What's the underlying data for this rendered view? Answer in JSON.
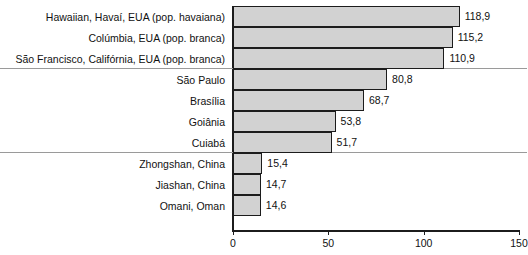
{
  "chart_data": {
    "type": "bar",
    "orientation": "horizontal",
    "title": "",
    "subtitle": "",
    "xlabel": "",
    "ylabel": "",
    "xlim": [
      0,
      150
    ],
    "xticks": [
      0,
      50,
      100,
      150
    ],
    "xtick_labels": [
      "0",
      "50",
      "100",
      "150"
    ],
    "grid": false,
    "legend": null,
    "decimal_separator": ",",
    "bar_fill_color": "#d2d2d2",
    "bar_border_color": "#1c1c1c",
    "axis_color": "#1c1c1c",
    "separator_color": "#9a9a9a",
    "categories": [
      "Hawaiian, Havaí, EUA (pop. havaiana)",
      "Colúmbia, EUA (pop. branca)",
      "São Francisco, Califórnia, EUA (pop. branca)",
      "São Paulo",
      "Brasília",
      "Goiânia",
      "Cuiabá",
      "Zhongshan, China",
      "Jiashan, China",
      "Omani, Oman"
    ],
    "values": [
      118.9,
      115.2,
      110.9,
      80.8,
      68.7,
      53.8,
      51.7,
      15.4,
      14.7,
      14.6
    ],
    "value_labels": [
      "118,9",
      "115,2",
      "110,9",
      "80,8",
      "68,7",
      "53,8",
      "51,7",
      "15,4",
      "14,7",
      "14,6"
    ],
    "group_separators_after": [
      2,
      6
    ]
  },
  "bars": [
    {
      "label": "Hawaiian, Havaí, EUA (pop. havaiana)",
      "value": 118.9,
      "value_label": "118,9"
    },
    {
      "label": "Colúmbia, EUA (pop. branca)",
      "value": 115.2,
      "value_label": "115,2"
    },
    {
      "label": "São Francisco, Califórnia, EUA (pop. branca)",
      "value": 110.9,
      "value_label": "110,9"
    },
    {
      "label": "São Paulo",
      "value": 80.8,
      "value_label": "80,8"
    },
    {
      "label": "Brasília",
      "value": 68.7,
      "value_label": "68,7"
    },
    {
      "label": "Goiânia",
      "value": 53.8,
      "value_label": "53,8"
    },
    {
      "label": "Cuiabá",
      "value": 51.7,
      "value_label": "51,7"
    },
    {
      "label": "Zhongshan, China",
      "value": 15.4,
      "value_label": "15,4"
    },
    {
      "label": "Jiashan, China",
      "value": 14.7,
      "value_label": "14,7"
    },
    {
      "label": "Omani, Oman",
      "value": 14.6,
      "value_label": "14,6"
    }
  ],
  "axis": {
    "ticks": [
      {
        "value": 0,
        "label": "0"
      },
      {
        "value": 50,
        "label": "50"
      },
      {
        "value": 100,
        "label": "100"
      },
      {
        "value": 150,
        "label": "150"
      }
    ]
  }
}
